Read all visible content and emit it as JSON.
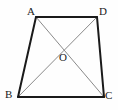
{
  "figure": {
    "type": "geometry-diagram",
    "shape": "quadrilateral-with-diagonals",
    "background_color": "#fefefe",
    "edge_color": "#1a1a1a",
    "diagonal_color": "#8a8a8a",
    "label_color": "#1a1a1a",
    "edge_width": 2,
    "diagonal_width": 1,
    "vertices": [
      {
        "id": "A",
        "label": "A",
        "x": 36,
        "y": 17,
        "label_x": 27,
        "label_y": 6
      },
      {
        "id": "D",
        "label": "D",
        "x": 97,
        "y": 17,
        "label_x": 99,
        "label_y": 6
      },
      {
        "id": "B",
        "label": "B",
        "x": 18,
        "y": 97,
        "label_x": 5,
        "label_y": 89
      },
      {
        "id": "C",
        "label": "C",
        "x": 104,
        "y": 97,
        "label_x": 105,
        "label_y": 90
      },
      {
        "id": "O",
        "label": "O",
        "x": 63,
        "y": 51,
        "label_x": 59,
        "label_y": 52
      }
    ],
    "edges": [
      {
        "name": "edge-AD",
        "from": "A",
        "to": "D"
      },
      {
        "name": "edge-AB",
        "from": "A",
        "to": "B"
      },
      {
        "name": "edge-BC",
        "from": "B",
        "to": "C"
      },
      {
        "name": "edge-DC",
        "from": "D",
        "to": "C"
      }
    ],
    "diagonals": [
      {
        "name": "diagonal-AC",
        "from": "A",
        "to": "C"
      },
      {
        "name": "diagonal-BD",
        "from": "B",
        "to": "D"
      }
    ],
    "intersection": {
      "name": "point-O",
      "label": "O",
      "x": 63,
      "y": 51
    }
  }
}
